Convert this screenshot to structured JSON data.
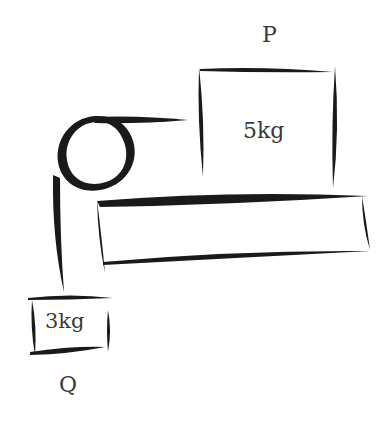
{
  "diagram": {
    "type": "pulley-system",
    "colors": {
      "stroke": "#1a1a1a",
      "text": "#3a3a3a",
      "background": "#ffffff"
    },
    "block_p": {
      "label": "P",
      "mass": "5kg"
    },
    "block_q": {
      "label": "Q",
      "mass": "3kg"
    },
    "table": {
      "label": ""
    },
    "pulley": {
      "label": ""
    }
  }
}
